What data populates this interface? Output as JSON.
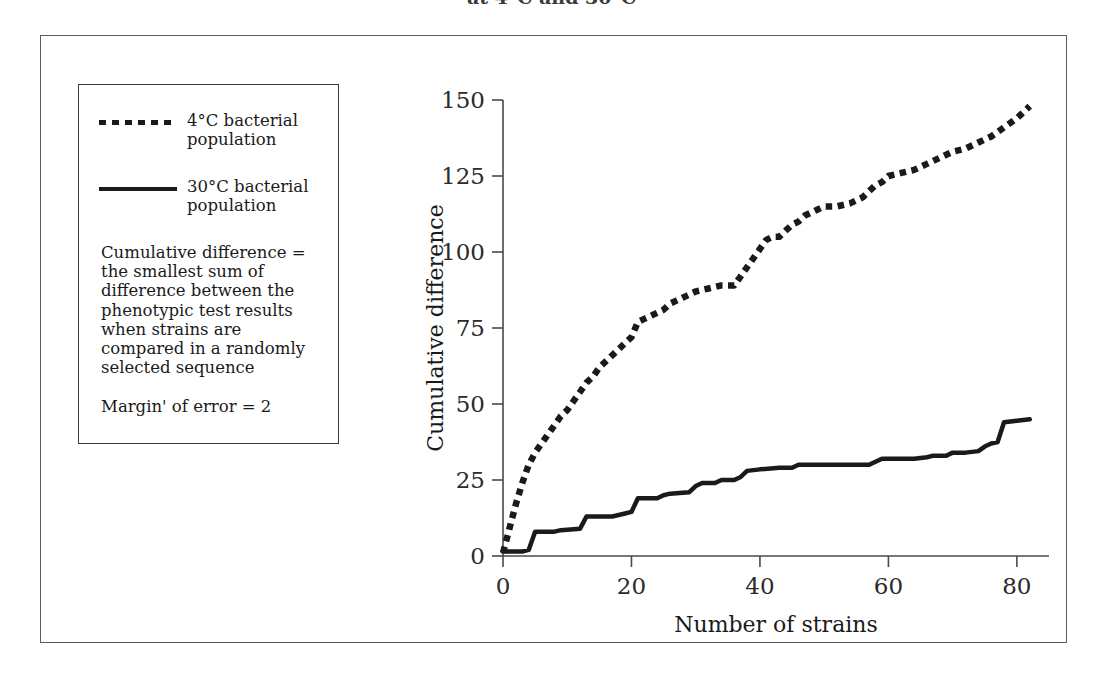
{
  "caption": {
    "text": "at 4°C and 30°C"
  },
  "legend": {
    "entries": [
      {
        "style": "dotted",
        "label": "4°C bacterial\npopulation"
      },
      {
        "style": "solid",
        "label": "30°C bacterial\npopulation"
      }
    ],
    "note": "Cumulative difference = the smallest sum of difference between the phenotypic test results when strains are compared in a randomly selected sequence",
    "margin_of_error": "Margin' of error = 2"
  },
  "chart_data": {
    "type": "line",
    "title": "",
    "xlabel": "Number of strains",
    "ylabel": "Cumulative difference",
    "xlim": [
      0,
      85
    ],
    "ylim": [
      0,
      150
    ],
    "xticks": [
      0,
      20,
      40,
      60,
      80
    ],
    "yticks": [
      0,
      25,
      50,
      75,
      100,
      125,
      150
    ],
    "grid": false,
    "legend_position": "outside-left",
    "series": [
      {
        "name": "4°C bacterial population",
        "style": "dotted",
        "color": "#1a1a1a",
        "x": [
          0,
          1,
          2,
          3,
          4,
          5,
          6,
          7,
          8,
          9,
          10,
          11,
          12,
          13,
          14,
          15,
          16,
          17,
          18,
          19,
          20,
          21,
          22,
          23,
          24,
          25,
          26,
          27,
          28,
          29,
          30,
          31,
          32,
          33,
          34,
          35,
          36,
          37,
          38,
          39,
          40,
          41,
          42,
          43,
          44,
          45,
          46,
          47,
          48,
          49,
          50,
          52,
          54,
          56,
          58,
          59,
          60,
          62,
          64,
          66,
          68,
          70,
          72,
          74,
          75,
          76,
          78,
          80,
          82
        ],
        "y": [
          1,
          9,
          17,
          24,
          30,
          34,
          37,
          40,
          43,
          46,
          48,
          51,
          54,
          57,
          59,
          62,
          64,
          66,
          68,
          70,
          72,
          77,
          78,
          79,
          80,
          81,
          83,
          84,
          85,
          86,
          87,
          87.5,
          88,
          88.5,
          89,
          89,
          89,
          92,
          95,
          98,
          101,
          104,
          105,
          105,
          107,
          109,
          110,
          112,
          113,
          114,
          115,
          115,
          116,
          118,
          122,
          123,
          125,
          126,
          127,
          129,
          131,
          133,
          134,
          136,
          137,
          138,
          141,
          144,
          148
        ]
      },
      {
        "name": "30°C bacterial population",
        "style": "solid",
        "color": "#1a1a1a",
        "x": [
          0,
          3,
          4,
          5,
          8,
          9,
          12,
          13,
          14,
          15,
          16,
          17,
          18,
          19,
          20,
          21,
          23,
          24,
          25,
          26,
          29,
          30,
          31,
          33,
          34,
          36,
          37,
          38,
          40,
          43,
          45,
          46,
          47,
          57,
          58,
          59,
          63,
          64,
          66,
          67,
          69,
          70,
          72,
          74,
          75,
          76,
          77,
          78,
          80,
          82
        ],
        "y": [
          1.5,
          1.5,
          2,
          8,
          8,
          8.5,
          9,
          13,
          13,
          13,
          13,
          13,
          13.5,
          14,
          14.5,
          19,
          19,
          19,
          20,
          20.5,
          21,
          23,
          24,
          24,
          25,
          25,
          26,
          28,
          28.5,
          29,
          29,
          30,
          30,
          30,
          31,
          32,
          32,
          32,
          32.5,
          33,
          33,
          34,
          34,
          34.5,
          36,
          37,
          37.5,
          44,
          44.5,
          45
        ]
      }
    ]
  }
}
